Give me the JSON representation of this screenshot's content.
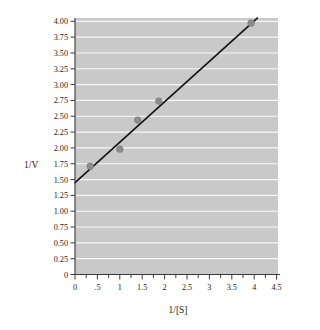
{
  "chart_data": {
    "type": "scatter",
    "title": "",
    "subtitle": "",
    "xlabel": "1/[S]",
    "ylabel": "1/V",
    "xlim": [
      0,
      4.75
    ],
    "ylim": [
      0,
      4.15
    ],
    "grid": "horizontal",
    "legend": "none",
    "plot_background_color": "#c9c9c9",
    "gridline_color": "#fdfdfd",
    "point_color": "#8c8c8c",
    "line_color": "#151515",
    "x_ticks": [
      0,
      0.5,
      1,
      1.5,
      2,
      2.5,
      3,
      3.5,
      4,
      4.5
    ],
    "x_tick_labels": [
      "0",
      ".5",
      "1",
      "1.5",
      "2",
      "2.5",
      "3",
      "3.5",
      "4",
      "4.5"
    ],
    "y_ticks": [
      0,
      0.25,
      0.5,
      0.75,
      1.0,
      1.25,
      1.5,
      1.75,
      2.0,
      2.25,
      2.5,
      2.75,
      3.0,
      3.25,
      3.5,
      3.75,
      4.0
    ],
    "y_tick_labels": [
      "0",
      "0.25",
      "0.50",
      "0.75",
      "1.00",
      "1.25",
      "1.50",
      "1.75",
      "2.00",
      "2.25",
      "2.50",
      "2.75",
      "3.00",
      "3.25",
      "3.50",
      "3.75",
      "4.00"
    ],
    "series": [
      {
        "name": "data points",
        "type": "scatter",
        "x": [
          0.34,
          1.0,
          1.4,
          1.87,
          3.93
        ],
        "y": [
          1.71,
          1.98,
          2.44,
          2.74,
          3.97
        ]
      },
      {
        "name": "best fit line",
        "type": "line",
        "x": [
          0.0,
          4.07
        ],
        "y": [
          1.45,
          4.05
        ],
        "slope": 0.64,
        "y_intercept": 1.45
      }
    ]
  },
  "axes": {
    "y_title": "1/V",
    "x_title": "1/[S]"
  }
}
